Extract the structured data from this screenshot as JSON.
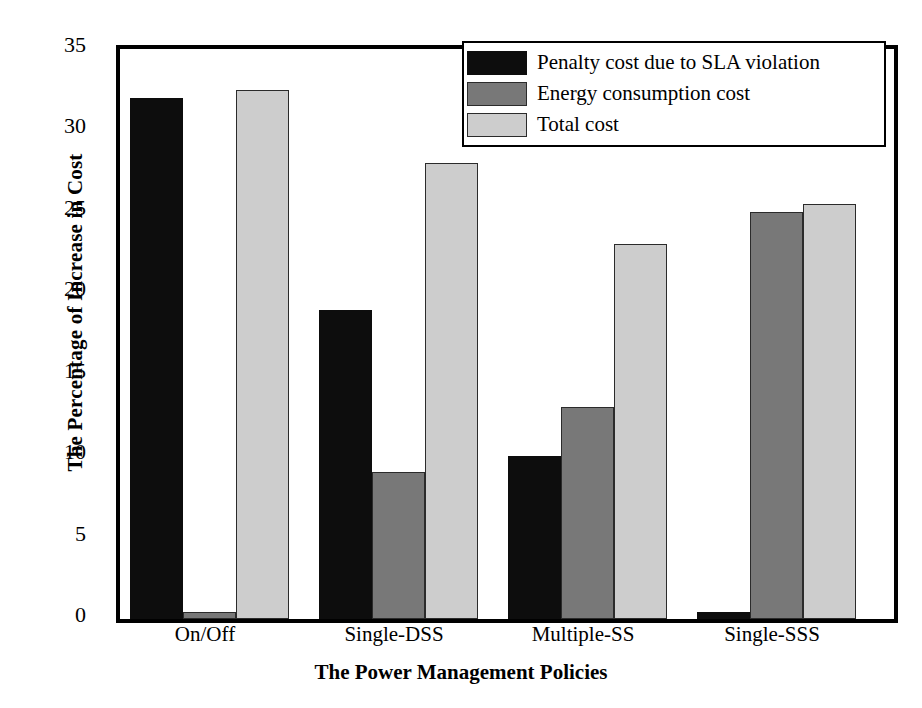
{
  "chart_data": {
    "type": "bar",
    "title": "",
    "xlabel": "The Power Management Policies",
    "ylabel": "The Percentage of Increase in Cost",
    "categories": [
      "On/Off",
      "Single-DSS",
      "Multiple-SS",
      "Single-SSS"
    ],
    "series": [
      {
        "name": "Penalty cost due to SLA violation",
        "color": "#0d0d0d",
        "values": [
          32.0,
          19.0,
          10.0,
          0.4
        ]
      },
      {
        "name": "Energy consumption cost",
        "color": "#787878",
        "values": [
          0.4,
          9.0,
          13.0,
          25.0
        ]
      },
      {
        "name": "Total cost",
        "color": "#cdcdcd",
        "values": [
          32.5,
          28.0,
          23.0,
          25.5
        ]
      }
    ],
    "ylim": [
      0,
      35
    ],
    "yticks": [
      0,
      5,
      10,
      15,
      20,
      25,
      30,
      35
    ],
    "ytick_labels": [
      "0",
      "5",
      "10",
      "15",
      "20",
      "25",
      "30",
      "35"
    ],
    "grid": false,
    "legend_position": "upper right"
  },
  "legend": {
    "entries": [
      {
        "label": "Penalty cost due to SLA violation"
      },
      {
        "label": "Energy consumption cost"
      },
      {
        "label": "Total cost"
      }
    ]
  }
}
